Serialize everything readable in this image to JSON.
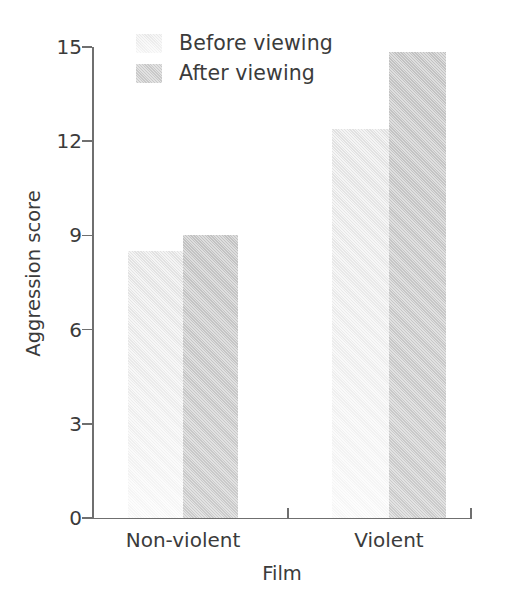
{
  "chart_data": {
    "type": "bar",
    "title": "",
    "subtitle": "",
    "xlabel": "Film",
    "ylabel": "Aggression score",
    "categories": [
      "Non-violent",
      "Violent"
    ],
    "series": [
      {
        "name": "Before viewing",
        "values": [
          8.5,
          12.4
        ],
        "color": "#f1f1f1"
      },
      {
        "name": "After viewing",
        "values": [
          9.0,
          14.85
        ],
        "color": "#cfcfcf"
      }
    ],
    "ylim": [
      0,
      15
    ],
    "yticks": [
      0,
      3,
      6,
      9,
      12,
      15
    ],
    "ytick_labels": [
      "0",
      "3",
      "6",
      "9",
      "12",
      "15"
    ],
    "grid": false,
    "legend_position": "top-left-inside",
    "background_color": "#ffffff",
    "axis_color": "#6f6f6f"
  },
  "legend": {
    "items": [
      {
        "label": "Before viewing",
        "swatch": "legend-swatch-before"
      },
      {
        "label": "After viewing",
        "swatch": "legend-swatch-after"
      }
    ]
  },
  "axes": {
    "y_title": "Aggression score",
    "x_title": "Film",
    "y_tick_0": "0",
    "y_tick_1": "3",
    "y_tick_2": "6",
    "y_tick_3": "9",
    "y_tick_4": "12",
    "y_tick_5": "15",
    "x_cat_0": "Non-violent",
    "x_cat_1": "Violent"
  }
}
